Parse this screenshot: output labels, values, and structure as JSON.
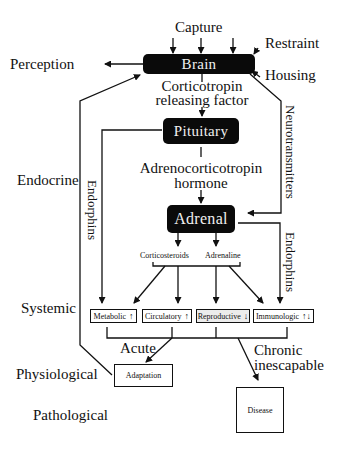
{
  "inputs": {
    "capture": "Capture",
    "restraint": "Restraint",
    "housing": "Housing"
  },
  "outputs": {
    "perception": "Perception"
  },
  "nodes": {
    "brain": "Brain",
    "pituitary": "Pituitary",
    "adrenal": "Adrenal",
    "adaptation": "Adaptation",
    "disease": "Disease"
  },
  "edges": {
    "crf_line1": "Corticotropin",
    "crf_line2": "releasing factor",
    "acth_line1": "Adrenocorticotropin",
    "acth_line2": "hormone",
    "neurotransmitters": "Neurotransmitters",
    "endorphins_left": "Endorphins",
    "endorphins_right": "Endorphins",
    "corticosteroids": "Corticosteroids",
    "adrenaline": "Adrenaline",
    "acute": "Acute",
    "chronic_line1": "Chronic",
    "chronic_line2": "inescapable"
  },
  "systems": [
    {
      "label": "Metabolic",
      "direction": "↑"
    },
    {
      "label": "Circulatory",
      "direction": "↑"
    },
    {
      "label": "Reproductive",
      "direction": "↓"
    },
    {
      "label": "Immunologic",
      "direction": "↑↓"
    }
  ],
  "levels": {
    "endocrine": "Endocrine",
    "systemic": "Systemic",
    "physiological": "Physiological",
    "pathological": "Pathological"
  }
}
